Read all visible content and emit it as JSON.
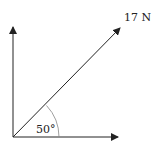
{
  "diagram": {
    "type": "force-vector",
    "force_label": "17 N",
    "angle_label": "50°",
    "angle_degrees": 50,
    "colors": {
      "line": "#222222",
      "arc": "#888888"
    }
  }
}
